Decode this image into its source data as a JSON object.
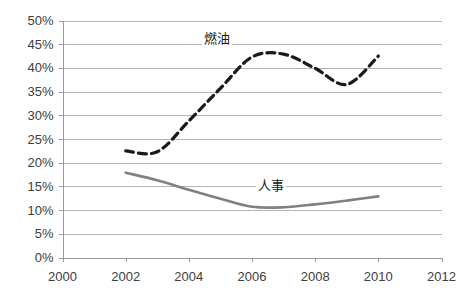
{
  "chart_data": {
    "type": "line",
    "title": "",
    "subtitle": "",
    "xlabel": "",
    "ylabel": "",
    "xlim": [
      2000,
      2012
    ],
    "ylim": [
      0,
      0.5
    ],
    "grid": true,
    "legend_position": "inline-labels",
    "x_tick_labels": [
      "2000",
      "2002",
      "2004",
      "2006",
      "2008",
      "2010",
      "2012"
    ],
    "x_tick_values": [
      2000,
      2002,
      2004,
      2006,
      2008,
      2010,
      2012
    ],
    "y_tick_labels": [
      "0%",
      "5%",
      "10%",
      "15%",
      "20%",
      "25%",
      "30%",
      "35%",
      "40%",
      "45%",
      "50%"
    ],
    "y_tick_values": [
      0,
      0.05,
      0.1,
      0.15,
      0.2,
      0.25,
      0.3,
      0.35,
      0.4,
      0.45,
      0.5
    ],
    "series": [
      {
        "name": "燃油",
        "label": "燃油",
        "style": "dashed",
        "color": "#1a1a1a",
        "x": [
          2002,
          2003,
          2004,
          2005,
          2006,
          2007,
          2008,
          2009,
          2010
        ],
        "values": [
          0.225,
          0.223,
          0.288,
          0.357,
          0.423,
          0.429,
          0.399,
          0.365,
          0.425
        ]
      },
      {
        "name": "人事",
        "label": "人事",
        "style": "solid",
        "color": "#808080",
        "x": [
          2002,
          2003,
          2004,
          2005,
          2006,
          2007,
          2008,
          2009,
          2010
        ],
        "values": [
          0.179,
          0.163,
          0.143,
          0.124,
          0.107,
          0.106,
          0.112,
          0.12,
          0.129
        ]
      }
    ],
    "annotations": [
      {
        "text": "燃油",
        "x": 2004.9,
        "y": 0.452
      },
      {
        "text": "人事",
        "x": 2006.6,
        "y": 0.143
      }
    ]
  }
}
